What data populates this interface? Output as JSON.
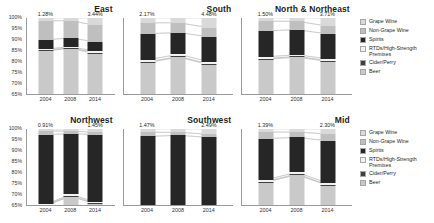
{
  "chart_data": {
    "type": "bar",
    "title": "",
    "subtitle": "",
    "xlabel": "",
    "ylabel": "",
    "stacked": true,
    "normalized_percent": true,
    "ylim": [
      65,
      100
    ],
    "yticks": [
      "100%",
      "95%",
      "90%",
      "85%",
      "80%",
      "75%",
      "70%",
      "65%"
    ],
    "ytick_values": [
      100,
      95,
      90,
      85,
      80,
      75,
      70,
      65
    ],
    "grid": false,
    "legend_position": "right",
    "categories": [
      "2004",
      "2008",
      "2014"
    ],
    "series_order": [
      "Beer",
      "Cider/Perry",
      "RTDs/High-Strength Premixes",
      "Spirits",
      "Non-Grape Wine",
      "Grape Wine"
    ],
    "colors": {
      "Grape Wine": "#d9d9d9",
      "Non-Grape Wine": "#bfbfbf",
      "Spirits": "#262626",
      "RTDs/High-Strength Premixes": "#f2f2f2",
      "Cider/Perry": "#404040",
      "Beer": "#c9c9c9",
      "axis": "#9a9a9a",
      "text": "#231f20"
    },
    "panels": [
      {
        "name": "East",
        "annotations": [
          {
            "category": "2004",
            "text": "1.28%"
          },
          {
            "category": "2014",
            "text": "3.44%"
          }
        ],
        "series": [
          {
            "name": "Beer",
            "values": [
              84.9,
              86.0,
              83.6
            ]
          },
          {
            "name": "Cider/Perry",
            "values": [
              0.3,
              0.3,
              0.4
            ]
          },
          {
            "name": "Spirits",
            "values": [
              4.3,
              4.0,
              4.4
            ]
          },
          {
            "name": "RTDs/High-Strength Premixes",
            "values": [
              0.5,
              0.5,
              0.6
            ]
          },
          {
            "name": "Non-Grape Wine",
            "values": [
              8.7,
              8.0,
              7.6
            ]
          },
          {
            "name": "Grape Wine",
            "values": [
              1.3,
              1.2,
              3.4
            ]
          }
        ]
      },
      {
        "name": "South",
        "annotations": [
          {
            "category": "2004",
            "text": "2.17%"
          },
          {
            "category": "2014",
            "text": "4.48%"
          }
        ],
        "series": [
          {
            "name": "Beer",
            "values": [
              79.5,
              82.0,
              78.4
            ]
          },
          {
            "name": "Cider/Perry",
            "values": [
              0.3,
              0.3,
              0.4
            ]
          },
          {
            "name": "Spirits",
            "values": [
              12.0,
              10.0,
              11.5
            ]
          },
          {
            "name": "RTDs/High-Strength Premixes",
            "values": [
              1.0,
              1.0,
              1.0
            ]
          },
          {
            "name": "Non-Grape Wine",
            "values": [
              5.0,
              4.5,
              4.2
            ]
          },
          {
            "name": "Grape Wine",
            "values": [
              2.2,
              2.2,
              4.5
            ]
          }
        ]
      },
      {
        "name": "North & Northeast",
        "annotations": [
          {
            "category": "2004",
            "text": "1.50%"
          },
          {
            "category": "2014",
            "text": "3.71%"
          }
        ],
        "series": [
          {
            "name": "Beer",
            "values": [
              81.0,
              82.0,
              80.0
            ]
          },
          {
            "name": "Cider/Perry",
            "values": [
              0.3,
              0.3,
              0.4
            ]
          },
          {
            "name": "Spirits",
            "values": [
              12.0,
              11.5,
              11.5
            ]
          },
          {
            "name": "RTDs/High-Strength Premixes",
            "values": [
              0.8,
              0.8,
              0.8
            ]
          },
          {
            "name": "Non-Grape Wine",
            "values": [
              4.4,
              3.9,
              3.6
            ]
          },
          {
            "name": "Grape Wine",
            "values": [
              1.5,
              1.5,
              3.7
            ]
          }
        ]
      },
      {
        "name": "Northwest",
        "annotations": [
          {
            "category": "2004",
            "text": "0.91%"
          },
          {
            "category": "2014",
            "text": "1.45%"
          }
        ],
        "series": [
          {
            "name": "Beer",
            "values": [
              64.5,
              69.0,
              65.5
            ]
          },
          {
            "name": "Cider/Perry",
            "values": [
              0.3,
              0.3,
              0.3
            ]
          },
          {
            "name": "Spirits",
            "values": [
              32.0,
              28.0,
              31.0
            ]
          },
          {
            "name": "RTDs/High-Strength Premixes",
            "values": [
              0.6,
              0.6,
              0.6
            ]
          },
          {
            "name": "Non-Grape Wine",
            "values": [
              1.7,
              1.2,
              1.1
            ]
          },
          {
            "name": "Grape Wine",
            "values": [
              0.9,
              0.9,
              1.5
            ]
          }
        ]
      },
      {
        "name": "Southwest",
        "annotations": [
          {
            "category": "2004",
            "text": "1.47%"
          },
          {
            "category": "2014",
            "text": "2.49%"
          }
        ],
        "series": [
          {
            "name": "Beer",
            "values": [
              52.0,
              57.5,
              53.0
            ]
          },
          {
            "name": "Cider/Perry",
            "values": [
              0.3,
              0.3,
              0.3
            ]
          },
          {
            "name": "Spirits",
            "values": [
              43.5,
              38.5,
              42.0
            ]
          },
          {
            "name": "RTDs/High-Strength Premixes",
            "values": [
              0.8,
              0.8,
              0.8
            ]
          },
          {
            "name": "Non-Grape Wine",
            "values": [
              1.9,
              1.4,
              1.4
            ]
          },
          {
            "name": "Grape Wine",
            "values": [
              1.5,
              1.5,
              2.5
            ]
          }
        ]
      },
      {
        "name": "Mid",
        "annotations": [
          {
            "category": "2004",
            "text": "1.39%"
          },
          {
            "category": "2014",
            "text": "2.30%"
          }
        ],
        "series": [
          {
            "name": "Beer",
            "values": [
              75.5,
              79.0,
              74.0
            ]
          },
          {
            "name": "Cider/Perry",
            "values": [
              0.3,
              0.3,
              0.3
            ]
          },
          {
            "name": "Spirits",
            "values": [
              19.0,
              16.0,
              19.5
            ]
          },
          {
            "name": "RTDs/High-Strength Premixes",
            "values": [
              0.8,
              0.8,
              0.8
            ]
          },
          {
            "name": "Non-Grape Wine",
            "values": [
              3.0,
              2.5,
              3.1
            ]
          },
          {
            "name": "Grape Wine",
            "values": [
              1.4,
              1.4,
              2.3
            ]
          }
        ]
      }
    ]
  },
  "legends": [
    {
      "items": [
        {
          "label": "Grape Wine",
          "color": "#d9d9d9"
        },
        {
          "label": "Non-Grape Wine",
          "color": "#bfbfbf"
        },
        {
          "label": "Spirits",
          "color": "#262626"
        },
        {
          "label": "RTDs/High-Strength Premixes",
          "color": "#f2f2f2"
        },
        {
          "label": "Cider/Perry",
          "color": "#404040"
        },
        {
          "label": "Beer",
          "color": "#c9c9c9"
        }
      ]
    },
    {
      "items": [
        {
          "label": "Grape Wine",
          "color": "#d9d9d9"
        },
        {
          "label": "Non-Grape Wine",
          "color": "#bfbfbf"
        },
        {
          "label": "Spirits",
          "color": "#262626"
        },
        {
          "label": "RTDs/High-Strength Premixes",
          "color": "#f2f2f2"
        },
        {
          "label": "Cider/Perry",
          "color": "#404040"
        },
        {
          "label": "Beer",
          "color": "#c9c9c9"
        }
      ]
    }
  ]
}
